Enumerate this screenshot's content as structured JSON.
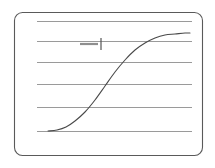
{
  "figure": {
    "title": "",
    "frame": {
      "x": 14,
      "y": 12,
      "width": 188,
      "height": 143,
      "corner_radius": 8,
      "border_color": "#5a5a5a",
      "background_color": "#ffffff"
    },
    "plot_area": {
      "left": 37,
      "right": 192,
      "top": 21,
      "bottom": 131
    },
    "gridlines": {
      "color": "#9a9a9a",
      "orientation": "horizontal",
      "count": 6,
      "y_positions": [
        21,
        41,
        62,
        84,
        107,
        131
      ],
      "x_start": 37,
      "x_end": 192
    },
    "legend": {
      "dash_label": "",
      "series_label": "1",
      "dash_color": "#8f8f8f",
      "tick_color": "#555555",
      "dash_x_start": 80,
      "dash_x_end": 98,
      "dash_y": 44,
      "tick_x": 101,
      "tick_y_top": 38,
      "tick_y_bottom": 50
    }
  },
  "chart_data": {
    "type": "line",
    "title": "",
    "subtitle": "",
    "xlabel": "",
    "ylabel": "",
    "xlim": [
      0,
      100
    ],
    "ylim": [
      0,
      100
    ],
    "grid": true,
    "grid_orientation": "horizontal",
    "legend_position": "upper-left-inside",
    "x_tick_labels": [],
    "y_tick_labels": [],
    "annotations": [],
    "series": [
      {
        "name": "1",
        "color": "#4a4a4a",
        "shape": "sigmoid",
        "x": [
          7,
          12,
          18,
          24,
          30,
          36,
          42,
          48,
          54,
          60,
          66,
          72,
          78,
          84,
          90,
          96,
          100
        ],
        "values": [
          0,
          1,
          3,
          7,
          13,
          22,
          33,
          45,
          57,
          68,
          77,
          84,
          89,
          92,
          94,
          95,
          95
        ],
        "pixel_points": [
          [
            48,
            131
          ],
          [
            57,
            130
          ],
          [
            66,
            127
          ],
          [
            75,
            121
          ],
          [
            85,
            112
          ],
          [
            95,
            100
          ],
          [
            105,
            86
          ],
          [
            115,
            72
          ],
          [
            125,
            60
          ],
          [
            135,
            50
          ],
          [
            145,
            43
          ],
          [
            155,
            38
          ],
          [
            165,
            35
          ],
          [
            175,
            34
          ],
          [
            185,
            33
          ],
          [
            190,
            33
          ]
        ]
      }
    ]
  }
}
